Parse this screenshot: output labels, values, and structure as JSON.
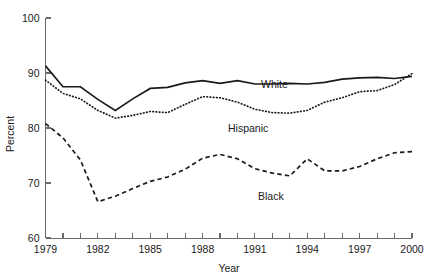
{
  "chart_data": {
    "type": "line",
    "title": "",
    "xlabel": "Year",
    "ylabel": "Percent",
    "xlim": [
      1979,
      2000
    ],
    "ylim": [
      60,
      100
    ],
    "ytick_labels": [
      "60",
      "70",
      "80",
      "90",
      "100"
    ],
    "yticks": [
      60,
      70,
      80,
      90,
      100
    ],
    "xtick_labels": [
      "1979",
      "1982",
      "1985",
      "1988",
      "1991",
      "1994",
      "1997",
      "2000"
    ],
    "xticks_major": [
      1979,
      1982,
      1985,
      1988,
      1991,
      1994,
      1997,
      2000
    ],
    "x": [
      1979,
      1980,
      1981,
      1982,
      1983,
      1984,
      1985,
      1986,
      1987,
      1988,
      1989,
      1990,
      1991,
      1992,
      1993,
      1994,
      1995,
      1996,
      1997,
      1998,
      1999,
      2000
    ],
    "grid": false,
    "legend_position": "inline-annotations",
    "series": [
      {
        "name": "White",
        "style": "solid",
        "label_text": "White",
        "values": [
          91.3,
          87.5,
          87.5,
          85.2,
          83.2,
          85.3,
          87.2,
          87.4,
          88.2,
          88.6,
          88.1,
          88.6,
          88.0,
          88.0,
          88.1,
          88.0,
          88.3,
          88.9,
          89.1,
          89.2,
          89.0,
          89.4
        ]
      },
      {
        "name": "Hispanic",
        "style": "dotted",
        "label_text": "Hispanic",
        "values": [
          88.7,
          86.3,
          85.3,
          83.2,
          81.8,
          82.3,
          83.0,
          82.8,
          84.3,
          85.7,
          85.5,
          84.7,
          83.4,
          82.8,
          82.7,
          83.2,
          84.7,
          85.5,
          86.6,
          86.8,
          87.9,
          89.9
        ]
      },
      {
        "name": "Black",
        "style": "dashed",
        "label_text": "Black",
        "values": [
          80.8,
          78.2,
          74.2,
          66.6,
          67.6,
          69.0,
          70.3,
          71.1,
          72.5,
          74.5,
          75.2,
          74.4,
          72.6,
          71.8,
          71.3,
          74.4,
          72.2,
          72.2,
          73.0,
          74.4,
          75.5,
          75.7
        ]
      }
    ]
  },
  "annotations": {
    "white_label": "White",
    "hispanic_label": "Hispanic",
    "black_label": "Black"
  },
  "colors": {
    "line": "#1a1a1a",
    "axis": "#6b6b6b",
    "background": "#ffffff"
  }
}
